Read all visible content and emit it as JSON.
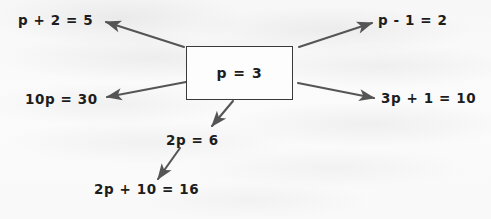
{
  "diagram": {
    "background_color": "#fafafa",
    "ink_color": "#1d1d1d",
    "arrow_color": "#555555",
    "center": {
      "label": "p = 3",
      "box_border_color": "#3a3a3a"
    },
    "branches": [
      {
        "id": "top-left",
        "label": "p + 2 = 5",
        "x": 18,
        "y": 14
      },
      {
        "id": "top-right",
        "label": "p - 1 = 2",
        "x": 378,
        "y": 14
      },
      {
        "id": "mid-left",
        "label": "10p = 30",
        "x": 25,
        "y": 93
      },
      {
        "id": "mid-right",
        "label": "3p + 1 = 10",
        "x": 381,
        "y": 92
      },
      {
        "id": "bottom-mid",
        "label": "2p = 6",
        "x": 166,
        "y": 134
      },
      {
        "id": "bottom-left",
        "label": "2p + 10 = 16",
        "x": 94,
        "y": 183
      }
    ],
    "arrows": [
      {
        "id": "arrow-to-top-left",
        "from": [
          184,
          47
        ],
        "to": [
          104,
          21
        ]
      },
      {
        "id": "arrow-to-top-right",
        "from": [
          299,
          47
        ],
        "to": [
          374,
          22
        ]
      },
      {
        "id": "arrow-to-mid-left",
        "from": [
          186,
          82
        ],
        "to": [
          105,
          98
        ]
      },
      {
        "id": "arrow-to-mid-right",
        "from": [
          298,
          83
        ],
        "to": [
          376,
          99
        ]
      },
      {
        "id": "arrow-to-bottom-mid",
        "from": [
          233,
          101
        ],
        "to": [
          210,
          128
        ]
      },
      {
        "id": "arrow-to-bottom-left",
        "from": [
          180,
          148
        ],
        "to": [
          156,
          181
        ]
      }
    ]
  }
}
